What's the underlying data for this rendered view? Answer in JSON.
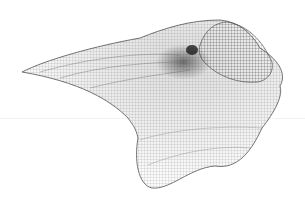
{
  "scene": {
    "description": "3D wireframe mesh render of a twisted organic surface",
    "background_color": "#ffffff",
    "mesh_color": "#222222",
    "horizon_color": "#f2f2f2"
  }
}
